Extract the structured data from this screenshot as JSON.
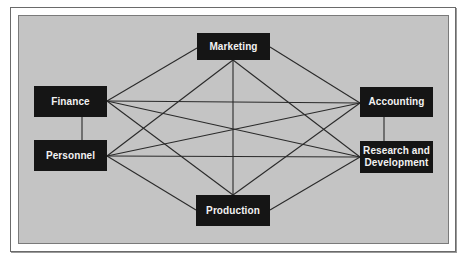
{
  "diagram": {
    "type": "full-mesh organizational communication network",
    "colors": {
      "page_background": "#ffffff",
      "panel_background": "#c4c4c4",
      "node_fill": "#151515",
      "node_text": "#f2f2f2",
      "edge": "#2a2a2a"
    },
    "nodes": [
      {
        "id": "marketing",
        "label": "Marketing",
        "x": 197,
        "y": 33,
        "w": 73,
        "h": 27
      },
      {
        "id": "finance",
        "label": "Finance",
        "x": 34,
        "y": 86,
        "w": 73,
        "h": 31
      },
      {
        "id": "personnel",
        "label": "Personnel",
        "x": 34,
        "y": 140,
        "w": 73,
        "h": 31
      },
      {
        "id": "accounting",
        "label": "Accounting",
        "x": 360,
        "y": 87,
        "w": 73,
        "h": 30
      },
      {
        "id": "research",
        "label": "Research and Development",
        "x": 360,
        "y": 141,
        "w": 73,
        "h": 32
      },
      {
        "id": "production",
        "label": "Production",
        "x": 196,
        "y": 195,
        "w": 74,
        "h": 31
      }
    ],
    "edges": [
      {
        "from": "finance",
        "to": "personnel",
        "x1": 82,
        "y1": 117,
        "x2": 82,
        "y2": 140
      },
      {
        "from": "accounting",
        "to": "research",
        "x1": 384,
        "y1": 117,
        "x2": 384,
        "y2": 141
      },
      {
        "from": "finance",
        "to": "marketing",
        "x1": 107,
        "y1": 101,
        "x2": 197,
        "y2": 48
      },
      {
        "from": "finance",
        "to": "accounting",
        "x1": 107,
        "y1": 101,
        "x2": 360,
        "y2": 103
      },
      {
        "from": "finance",
        "to": "research",
        "x1": 107,
        "y1": 101,
        "x2": 360,
        "y2": 157
      },
      {
        "from": "finance",
        "to": "production",
        "x1": 107,
        "y1": 101,
        "x2": 233,
        "y2": 195
      },
      {
        "from": "personnel",
        "to": "marketing",
        "x1": 107,
        "y1": 156,
        "x2": 233,
        "y2": 60
      },
      {
        "from": "personnel",
        "to": "accounting",
        "x1": 107,
        "y1": 156,
        "x2": 360,
        "y2": 103
      },
      {
        "from": "personnel",
        "to": "research",
        "x1": 107,
        "y1": 156,
        "x2": 360,
        "y2": 157
      },
      {
        "from": "personnel",
        "to": "production",
        "x1": 107,
        "y1": 156,
        "x2": 196,
        "y2": 210
      },
      {
        "from": "marketing",
        "to": "production",
        "x1": 233,
        "y1": 60,
        "x2": 233,
        "y2": 195
      },
      {
        "from": "marketing",
        "to": "accounting",
        "x1": 270,
        "y1": 47,
        "x2": 360,
        "y2": 103
      },
      {
        "from": "marketing",
        "to": "research",
        "x1": 233,
        "y1": 60,
        "x2": 360,
        "y2": 157
      },
      {
        "from": "production",
        "to": "accounting",
        "x1": 233,
        "y1": 195,
        "x2": 360,
        "y2": 103
      },
      {
        "from": "production",
        "to": "research",
        "x1": 270,
        "y1": 210,
        "x2": 360,
        "y2": 157
      }
    ]
  }
}
